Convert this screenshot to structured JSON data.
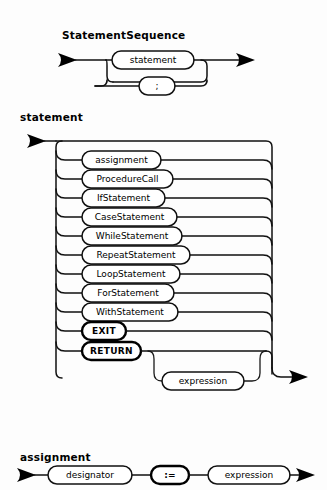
{
  "page": {
    "kind": "syntax-railroad-diagrams",
    "background": "#ffffff",
    "ink": "#000000",
    "width": 327,
    "height": 490
  },
  "diagrams": [
    {
      "id": "statement-sequence",
      "title": "StatementSequence",
      "nodes": [
        {
          "id": "ss-statement",
          "label": "statement",
          "kind": "nonterminal"
        },
        {
          "id": "ss-semicolon",
          "label": ";",
          "kind": "terminal-punct"
        }
      ]
    },
    {
      "id": "statement",
      "title": "statement",
      "alternatives": [
        {
          "id": "alt-assignment",
          "label": "assignment",
          "kind": "nonterminal"
        },
        {
          "id": "alt-procedurecall",
          "label": "ProcedureCall",
          "kind": "nonterminal"
        },
        {
          "id": "alt-ifstatement",
          "label": "IfStatement",
          "kind": "nonterminal"
        },
        {
          "id": "alt-casestatement",
          "label": "CaseStatement",
          "kind": "nonterminal"
        },
        {
          "id": "alt-whilestatement",
          "label": "WhileStatement",
          "kind": "nonterminal"
        },
        {
          "id": "alt-repeatstatement",
          "label": "RepeatStatement",
          "kind": "nonterminal"
        },
        {
          "id": "alt-loopstatement",
          "label": "LoopStatement",
          "kind": "nonterminal"
        },
        {
          "id": "alt-forstatement",
          "label": "ForStatement",
          "kind": "nonterminal"
        },
        {
          "id": "alt-withstatement",
          "label": "WithStatement",
          "kind": "nonterminal"
        },
        {
          "id": "alt-exit",
          "label": "EXIT",
          "kind": "terminal"
        },
        {
          "id": "alt-return",
          "label": "RETURN",
          "kind": "terminal"
        }
      ],
      "optional": [
        {
          "id": "opt-expression",
          "label": "expression",
          "kind": "nonterminal"
        }
      ]
    },
    {
      "id": "assignment",
      "title": "assignment",
      "sequence": [
        {
          "id": "asg-designator",
          "label": "designator",
          "kind": "nonterminal"
        },
        {
          "id": "asg-becomes",
          "label": ":=",
          "kind": "terminal"
        },
        {
          "id": "asg-expression",
          "label": "expression",
          "kind": "nonterminal"
        }
      ]
    }
  ]
}
